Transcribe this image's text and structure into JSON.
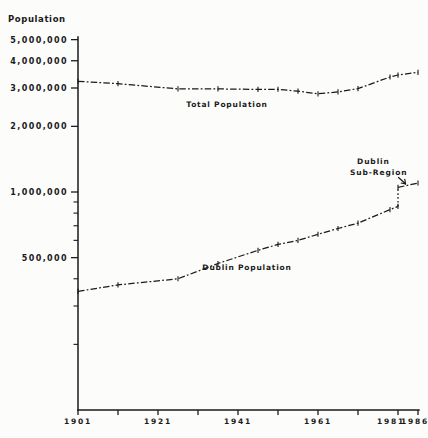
{
  "page": {
    "background": "#fcfcfa",
    "ink": "#1a1a1a"
  },
  "header": {
    "y_axis_title": "Population"
  },
  "chart_data": {
    "type": "line",
    "title": "",
    "xlabel": "",
    "ylabel": "Population",
    "x_scale": "linear",
    "y_scale": "log",
    "xlim": [
      1901,
      1986
    ],
    "ylim": [
      100000,
      5200000
    ],
    "grid": false,
    "legend_position": "inline-labels",
    "x_tick_years": [
      1901,
      1911,
      1921,
      1931,
      1941,
      1951,
      1961,
      1971,
      1981,
      1986
    ],
    "x_tick_labels": [
      {
        "year": 1901,
        "text": "1901"
      },
      {
        "year": 1921,
        "text": "1921"
      },
      {
        "year": 1941,
        "text": "1941"
      },
      {
        "year": 1961,
        "text": "1961"
      },
      {
        "year": 1981,
        "text": "1981"
      },
      {
        "year": 1986,
        "text": "1986"
      }
    ],
    "y_major_ticks": [
      {
        "value": 5000000,
        "text": "5,000,000"
      },
      {
        "value": 4000000,
        "text": "4,000,000"
      },
      {
        "value": 3000000,
        "text": "3,000,000"
      },
      {
        "value": 2000000,
        "text": "2,000,000"
      },
      {
        "value": 1000000,
        "text": "1,000,000"
      },
      {
        "value": 500000,
        "text": "500,000"
      }
    ],
    "y_minor_tick_values": [
      900000,
      800000,
      700000,
      600000,
      400000,
      300000,
      200000
    ],
    "series": [
      {
        "name": "total-population",
        "label": "Total Population",
        "x": [
          1901,
          1911,
          1926,
          1936,
          1946,
          1951,
          1956,
          1961,
          1966,
          1971,
          1979,
          1981,
          1986
        ],
        "values": [
          3220000,
          3140000,
          2970000,
          2970000,
          2955000,
          2960000,
          2900000,
          2820000,
          2880000,
          2980000,
          3370000,
          3440000,
          3540000
        ]
      },
      {
        "name": "dublin-population",
        "label": "Dublin Population",
        "x": [
          1901,
          1911,
          1926,
          1936,
          1946,
          1951,
          1956,
          1961,
          1966,
          1971,
          1979,
          1981
        ],
        "values": [
          350000,
          375000,
          400000,
          470000,
          540000,
          575000,
          600000,
          640000,
          680000,
          720000,
          830000,
          860000
        ]
      },
      {
        "name": "dublin-sub-region",
        "label": "Dublin Sub-Region",
        "x": [
          1981,
          1986
        ],
        "values": [
          1050000,
          1100000
        ],
        "connector_from_series": "dublin-population",
        "connector_style": "dotted-vertical"
      }
    ],
    "annotations": [
      {
        "name": "dublin-sub-region-callout",
        "lines": [
          "Dublin",
          "Sub-Region"
        ],
        "arrow_to_series": "dublin-sub-region"
      }
    ]
  }
}
